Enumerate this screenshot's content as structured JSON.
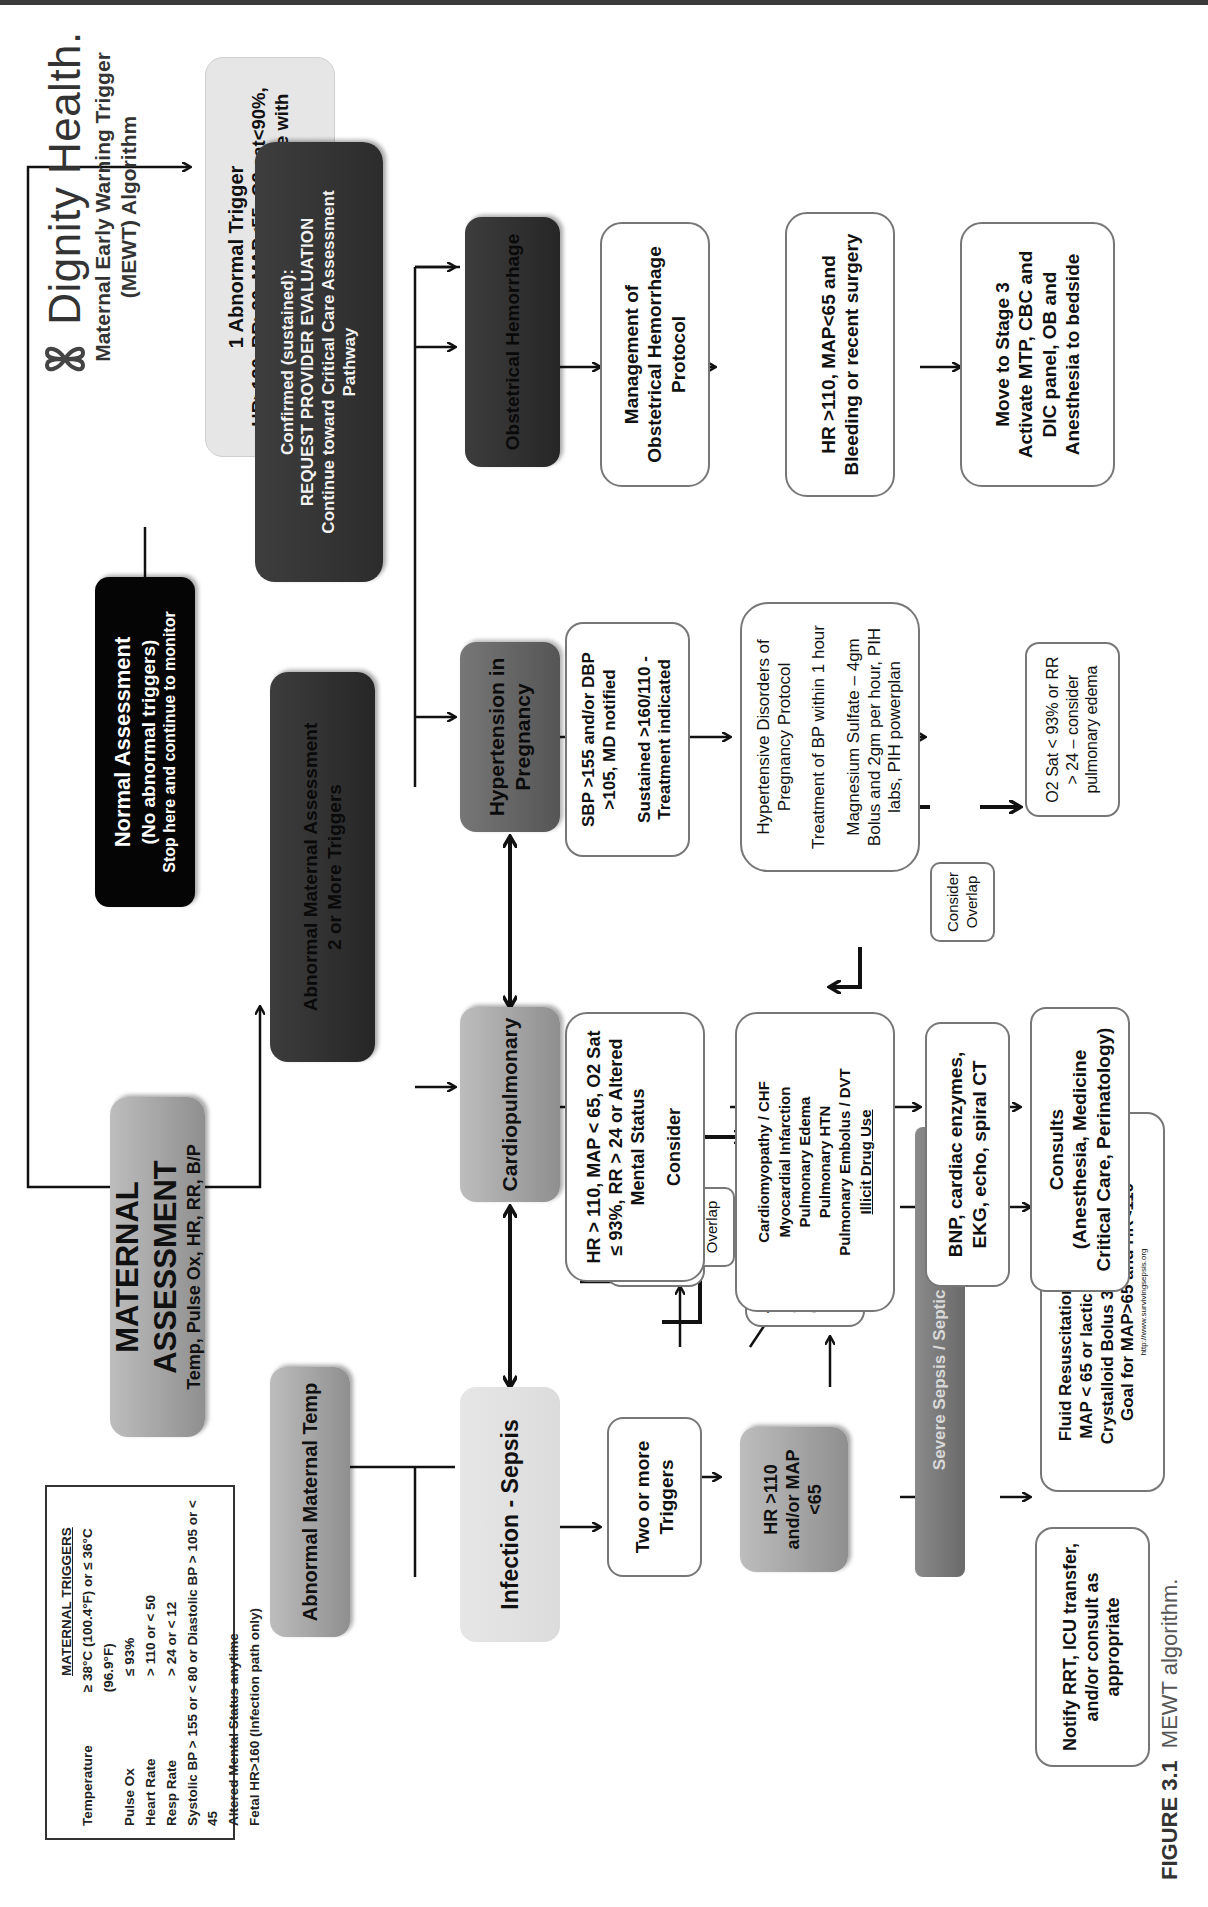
{
  "brand": {
    "name": "Dignity Health.",
    "subtitle_line1": "Maternal Early Warning Trigger",
    "subtitle_line2": "(MEWT) Algorithm",
    "logo_icon": "four-petal-knot-logo"
  },
  "triggers_box": {
    "title": "MATERNAL TRIGGERS",
    "rows": [
      {
        "label": "Temperature",
        "value": "≥ 38°C (100.4°F) or ≤ 36°C (96.9°F)"
      },
      {
        "label": "Pulse Ox",
        "value": "≤ 93%"
      },
      {
        "label": "Heart Rate",
        "value": "> 110 or < 50"
      },
      {
        "label": "Resp Rate",
        "value": "> 24 or < 12"
      }
    ],
    "extra_lines": [
      "Systolic BP > 155 or < 80 or Diastolic BP > 105 or < 45",
      "Altered Mental Status anytime",
      "Fetal HR>160 (Infection path only)"
    ]
  },
  "nodes": {
    "maternal_assessment": {
      "title": "MATERNAL ASSESSMENT",
      "subtitle": "Temp, Pulse Ox, HR, RR, B/P"
    },
    "normal_assessment": {
      "line1": "Normal Assessment",
      "line2": "(No abnormal triggers)",
      "line3": "Stop here and continue to monitor"
    },
    "one_trigger": {
      "line1": "1 Abnormal Trigger",
      "line2": "HR>130, RR>30, MAP<55, O2 sat<90%, nursing clinically uncomfortable with patient status*"
    },
    "abnormal_2plus": {
      "line1": "Abnormal Maternal Assessment",
      "line2": "2 or More Triggers"
    },
    "confirmed": {
      "line1": "Confirmed (sustained):",
      "line2": "REQUEST PROVIDER EVALUATION",
      "line3": "Continue toward Critical Care Assessment Pathway"
    },
    "abnormal_temp": {
      "label": "Abnormal Maternal Temp"
    },
    "infection_sepsis": {
      "label": "Infection - Sepsis"
    },
    "cardiopulmonary": {
      "label": "Cardiopulmonary"
    },
    "hypertension": {
      "label": "Hypertension in Pregnancy"
    },
    "ob_hemorrhage": {
      "label": "Obstetrical Hemorrhage"
    },
    "two_or_more_triggers": {
      "label": "Two or more Triggers"
    },
    "notify_physician": {
      "label": "Notify Physician, CBC, antibiotics, consider blood cultures"
    },
    "hr110_map65": {
      "label": "HR >110 and/or MAP <65"
    },
    "test_organ": {
      "line1": "Test organ dysfunction:",
      "line2": "(lactic acid, LFTs total bili,",
      "line3": "Creatinine,",
      "line4": "Urine Output)"
    },
    "severe_sepsis": {
      "label": "Severe Sepsis / Septic Shock"
    },
    "notify_rrt": {
      "label": "Notify RRT, ICU transfer, and/or consult as appropriate"
    },
    "fluid_resus": {
      "line1": "Fluid Resuscitation (within 1 hour)",
      "line2": "MAP < 65 or lactic acid > 4mmol/L",
      "line3": "Crystalloid Bolus 30ml/kg over 1 hr",
      "line4": "Goal for MAP>65 and HR<110",
      "line5": "http://www.survivingsepsis.org"
    },
    "consider_overlap_1": {
      "label": "Consider Overlap"
    },
    "consider_overlap_2": {
      "label": "Consider Overlap"
    },
    "cardio_criteria": {
      "line1": "HR > 110, MAP < 65, O2 Sat ≤ 93%, RR > 24 or Altered Mental Status",
      "line2": "Consider"
    },
    "cardio_conditions": {
      "items": [
        "Cardiomyopathy / CHF",
        "Myocardial Infarction",
        "Pulmonary Edema",
        "Pulmonary HTN",
        "Pulmonary Embolus / DVT",
        "Illicit Drug Use"
      ]
    },
    "cardio_tests": {
      "label": "BNP, cardiac enzymes, EKG, echo, spiral CT"
    },
    "consults": {
      "line1": "Consults",
      "line2": "(Anesthesia, Medicine Critical Care, Perinatology)"
    },
    "htn_criteria": {
      "line1": "SBP >155 and/or DBP >105, MD notified",
      "line2": "Sustained >160/110 - Treatment indicated"
    },
    "htn_protocol": {
      "line1": "Hypertensive Disorders of Pregnancy Protocol",
      "line2": "Treatment of BP within 1 hour",
      "line3": "Magnesium Sulfate – 4gm Bolus and 2gm per hour, PIH labs, PIH powerplan"
    },
    "o2_sat": {
      "label": "O2 Sat < 93% or RR > 24 – consider pulmonary edema"
    },
    "ob_protocol": {
      "label": "Management of Obstetrical Hemorrhage Protocol"
    },
    "ob_criteria": {
      "label": "HR >110, MAP<65 and Bleeding or recent surgery"
    },
    "stage3": {
      "line1": "Move to Stage 3",
      "line2": "Activate MTP, CBC and DIC panel, OB and Anesthesia to bedside"
    }
  },
  "caption": {
    "figure": "FIGURE 3.1",
    "text": "MEWT algorithm."
  }
}
